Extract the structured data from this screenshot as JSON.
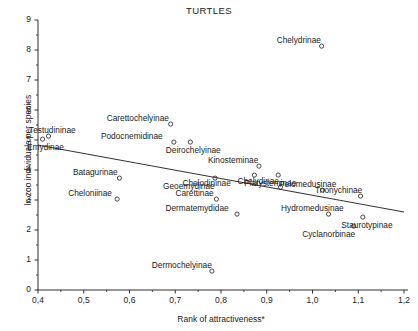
{
  "chart_data": {
    "type": "scatter",
    "title": "TURTLES",
    "xlabel": "Rank of attractiveness*",
    "ylabel": "ln zoo individuals per species",
    "xlim": [
      0.4,
      1.2
    ],
    "ylim": [
      0,
      9
    ],
    "xticks": [
      "0,4",
      "0,5",
      "0,6",
      "0,7",
      "0,8",
      "0,9",
      "1,0",
      "1,1",
      "1,2"
    ],
    "xtick_values": [
      0.4,
      0.5,
      0.6,
      0.7,
      0.8,
      0.9,
      1.0,
      1.1,
      1.2
    ],
    "yticks": [
      "0",
      "1",
      "2",
      "3",
      "4",
      "5",
      "6",
      "7",
      "8",
      "9"
    ],
    "ytick_values": [
      0,
      1,
      2,
      3,
      4,
      5,
      6,
      7,
      8,
      9
    ],
    "grid": false,
    "legend": "none",
    "marker": "open-circle",
    "marker_color": "#333333",
    "trendline": {
      "type": "linear-fit",
      "x_start": 0.4,
      "y_start": 4.83,
      "x_end": 1.2,
      "y_end": 2.6,
      "color": "#1a1a1a"
    },
    "points": [
      {
        "label": "Emydinae",
        "x": 0.41,
        "y": 5.03,
        "label_dx": 3,
        "label_dy": 4
      },
      {
        "label": "Testudininae",
        "x": 0.423,
        "y": 5.13,
        "label_dx": 4,
        "label_dy": -5
      },
      {
        "label": "Carettochelyinae",
        "x": 0.69,
        "y": 5.53,
        "label_dx": -33,
        "label_dy": -5
      },
      {
        "label": "Podocnemidinae",
        "x": 0.697,
        "y": 4.93,
        "label_dx": -42,
        "label_dy": -5
      },
      {
        "label": "Deirochelyinae",
        "x": 0.733,
        "y": 4.93,
        "label_dx": 3,
        "label_dy": 4
      },
      {
        "label": "Chelydrinae",
        "x": 1.02,
        "y": 8.13,
        "label_dx": -23,
        "label_dy": -5
      },
      {
        "label": "Batagurinae",
        "x": 0.578,
        "y": 3.73,
        "label_dx": -24,
        "label_dy": -5
      },
      {
        "label": "Geoemydinae",
        "x": 0.787,
        "y": 3.73,
        "label_dx": -26,
        "label_dy": 4
      },
      {
        "label": "Cheloniinae",
        "x": 0.573,
        "y": 3.03,
        "label_dx": -27,
        "label_dy": -5
      },
      {
        "label": "Carettinae",
        "x": 0.79,
        "y": 3.03,
        "label_dx": -22,
        "label_dy": -5
      },
      {
        "label": "Kinosteminae",
        "x": 0.883,
        "y": 4.13,
        "label_dx": -26,
        "label_dy": -5
      },
      {
        "label": "Chelodininae",
        "x": 0.873,
        "y": 3.83,
        "label_dx": -48,
        "label_dy": 1
      },
      {
        "label": "Platysteminae",
        "x": 0.925,
        "y": 3.83,
        "label_dx": -8,
        "label_dy": 1
      },
      {
        "label": "Chelydinae",
        "x": 0.93,
        "y": 3.43,
        "label_dx": -22,
        "label_dy": -4
      },
      {
        "label": "Pelomedusinae",
        "x": 1.022,
        "y": 3.33,
        "label_dx": -15,
        "label_dy": -5
      },
      {
        "label": "Trionychinae",
        "x": 1.105,
        "y": 3.13,
        "label_dx": -22,
        "label_dy": -5
      },
      {
        "label": "Dermatemydidae",
        "x": 0.835,
        "y": 2.53,
        "label_dx": -40,
        "label_dy": -4
      },
      {
        "label": "Hydromedusinae",
        "x": 1.035,
        "y": 2.53,
        "label_dx": -16,
        "label_dy": -4
      },
      {
        "label": "Staurotypinae",
        "x": 1.11,
        "y": 2.43,
        "label_dx": 4,
        "label_dy": 3
      },
      {
        "label": "Cyclanorbinae",
        "x": 1.09,
        "y": 2.13,
        "label_dx": -25,
        "label_dy": 4
      },
      {
        "label": "Dermochelyinae",
        "x": 0.78,
        "y": 0.63,
        "label_dx": -30,
        "label_dy": -5
      }
    ]
  }
}
